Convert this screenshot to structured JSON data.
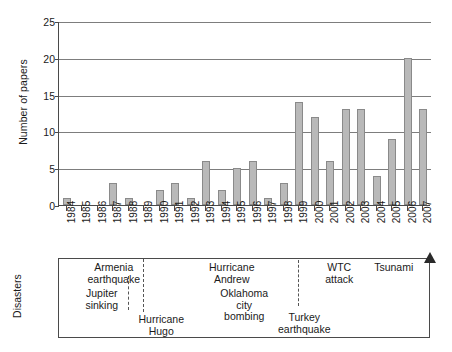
{
  "chart_data": {
    "type": "bar",
    "title": "",
    "xlabel": "",
    "ylabel": "Number of papers",
    "ylim": [
      0,
      25
    ],
    "yticks": [
      0,
      5,
      10,
      15,
      20,
      25
    ],
    "grid": true,
    "legend": null,
    "categories": [
      "1984",
      "1985",
      "1986",
      "1987",
      "1988",
      "1989",
      "1990",
      "1991",
      "1992",
      "1993",
      "1994",
      "1995",
      "1996",
      "1997",
      "1998",
      "1999",
      "2000",
      "2001",
      "2002",
      "2003",
      "2004",
      "2005",
      "2006",
      "2007"
    ],
    "values": [
      1,
      0,
      0,
      3,
      1,
      0,
      2,
      3,
      1,
      6,
      2,
      5,
      6,
      1,
      3,
      14,
      12,
      6,
      13,
      13,
      4,
      9,
      20,
      13
    ],
    "bar_color": "#b9b9b9",
    "bar_border_color": "#8a8a8a",
    "annotations_axis_label": "Disasters",
    "annotations": [
      {
        "label": "Armenia\nearthquake",
        "year": "1988"
      },
      {
        "label": "Jupiter\nsinking",
        "year": "1988"
      },
      {
        "label": "Hurricane\nHugo",
        "year": "1989"
      },
      {
        "label": "Hurricane\nAndrew",
        "year": "1992"
      },
      {
        "label": "Oklahoma\ncity\nbombing",
        "year": "1995"
      },
      {
        "label": "Turkey\nearthquake",
        "year": "1999"
      },
      {
        "label": "WTC\nattack",
        "year": "2001"
      },
      {
        "label": "Tsunami",
        "year": "2004"
      }
    ]
  }
}
